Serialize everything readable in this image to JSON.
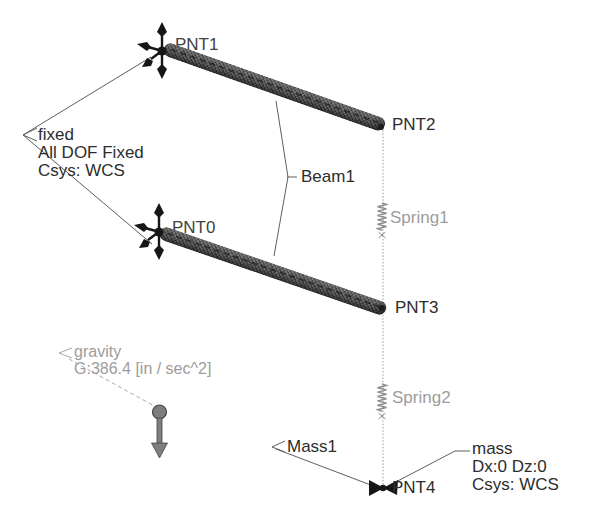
{
  "viewport": {
    "width": 591,
    "height": 520,
    "background": "#ffffff"
  },
  "labels": {
    "pnt0": "PNT0",
    "pnt1": "PNT1",
    "pnt2": "PNT2",
    "pnt3": "PNT3",
    "pnt4": "PNT4",
    "beam1": "Beam1",
    "spring1": "Spring1",
    "spring2": "Spring2",
    "mass1": "Mass1"
  },
  "notes": {
    "constraint": {
      "name": "fixed",
      "detail1": "All DOF Fixed",
      "detail2": "Csys: WCS"
    },
    "gravity": {
      "name": "gravity",
      "detail1": "G:386.4 [in / sec^2]"
    },
    "mass": {
      "name": "mass",
      "detail1": "Dx:0 Dz:0",
      "detail2": "Csys: WCS"
    }
  },
  "colors": {
    "beam_gray": "#6b6b6b",
    "entity_black": "#161616",
    "label_dark": "#2d2d2d",
    "label_gray": "#9c9c9c",
    "leader_line": "#5f5f5f",
    "spring_gray": "#8e8e8e",
    "gravity_gray": "#7e7e7e"
  }
}
